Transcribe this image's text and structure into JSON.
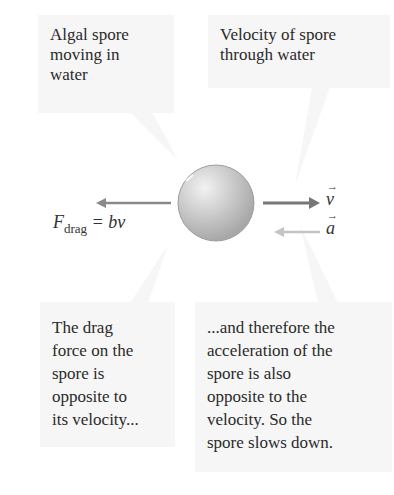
{
  "callouts": {
    "top_left": "Algal spore\nmoving in\nwater",
    "top_right": "Velocity of spore\nthrough water",
    "bottom_left": "The drag\nforce on the\nspore is\nopposite to\nits velocity...",
    "bottom_right": "...and therefore the\nacceleration of the\nspore is also\nopposite to the\nvelocity. So the\nspore slows down."
  },
  "labels": {
    "force_symbol": "F",
    "force_subscript": "drag",
    "force_equation": " = bv",
    "velocity_vector": "v",
    "acceleration_vector": "a"
  },
  "colors": {
    "callout_bg": "#f6f6f6",
    "velocity_arrow": "#777777",
    "drag_arrow": "#8a8a8a",
    "acceleration_arrow": "#c4c4c4",
    "spore": "#c8c8c8"
  }
}
